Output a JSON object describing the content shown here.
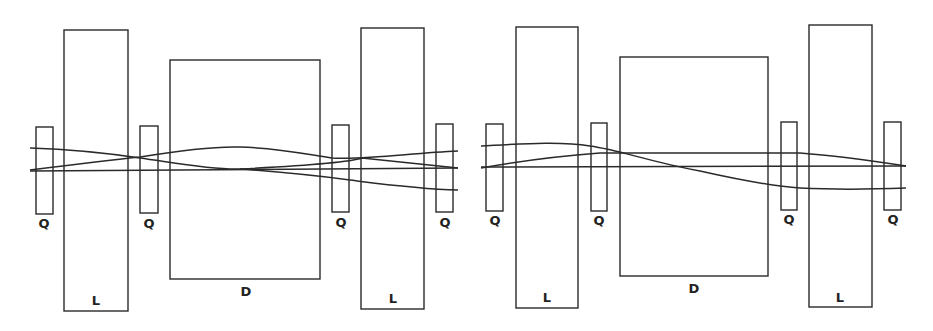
{
  "diagram": {
    "stroke_color": "#2a2a2a",
    "background": "#ffffff",
    "panels": [
      {
        "name": "left",
        "elements": [
          {
            "type": "Q",
            "label": "Q",
            "x": 36,
            "y": 127,
            "w": 17,
            "h": 87,
            "label_x": 44,
            "label_y": 228
          },
          {
            "type": "L",
            "label": "L",
            "x": 64,
            "y": 30,
            "w": 64,
            "h": 281,
            "label_x": 96,
            "label_y": 305
          },
          {
            "type": "Q",
            "label": "Q",
            "x": 140,
            "y": 126,
            "w": 18,
            "h": 87,
            "label_x": 149,
            "label_y": 228
          },
          {
            "type": "D",
            "label": "D",
            "x": 170,
            "y": 60,
            "w": 150,
            "h": 219,
            "label_x": 246,
            "label_y": 296
          },
          {
            "type": "Q",
            "label": "Q",
            "x": 332,
            "y": 125,
            "w": 17,
            "h": 87,
            "label_x": 341,
            "label_y": 227
          },
          {
            "type": "L",
            "label": "L",
            "x": 361,
            "y": 28,
            "w": 63,
            "h": 281,
            "label_x": 393,
            "label_y": 303
          },
          {
            "type": "Q",
            "label": "Q",
            "x": 436,
            "y": 124,
            "w": 17,
            "h": 88,
            "label_x": 445,
            "label_y": 227
          }
        ],
        "trajectories": [
          "M30,171 L458,168",
          "M30,148 C60,149 100,152 140,158 C170,162 210,170 240,169 C280,172 320,176 350,180 C390,185 420,189 458,190",
          "M30,170 C70,165 110,160 140,157 C170,152 210,146 240,147 C280,148 310,155 332,158 C370,160 410,153 458,151",
          "M240,169 C300,166 350,162 362,158 C400,162 430,165 458,168"
        ]
      },
      {
        "name": "right",
        "elements": [
          {
            "type": "Q",
            "label": "Q",
            "x": 486,
            "y": 124,
            "w": 17,
            "h": 87,
            "label_x": 495,
            "label_y": 225
          },
          {
            "type": "L",
            "label": "L",
            "x": 516,
            "y": 27,
            "w": 62,
            "h": 281,
            "label_x": 547,
            "label_y": 302
          },
          {
            "type": "Q",
            "label": "Q",
            "x": 591,
            "y": 123,
            "w": 16,
            "h": 88,
            "label_x": 599,
            "label_y": 225
          },
          {
            "type": "D",
            "label": "D",
            "x": 620,
            "y": 57,
            "w": 148,
            "h": 219,
            "label_x": 694,
            "label_y": 293
          },
          {
            "type": "Q",
            "label": "Q",
            "x": 781,
            "y": 122,
            "w": 16,
            "h": 88,
            "label_x": 789,
            "label_y": 224
          },
          {
            "type": "L",
            "label": "L",
            "x": 809,
            "y": 25,
            "w": 63,
            "h": 282,
            "label_x": 840,
            "label_y": 302
          },
          {
            "type": "Q",
            "label": "Q",
            "x": 884,
            "y": 122,
            "w": 17,
            "h": 88,
            "label_x": 893,
            "label_y": 224
          }
        ],
        "trajectories": [
          "M481,167 L906,166",
          "M481,146 C520,144 560,141 590,146 C620,150 650,162 700,171 C740,180 770,186 800,188 C840,190 880,189 906,188",
          "M481,168 C520,161 560,156 600,153 C660,153 720,153 800,153 C840,156 880,162 906,166"
        ]
      }
    ]
  }
}
